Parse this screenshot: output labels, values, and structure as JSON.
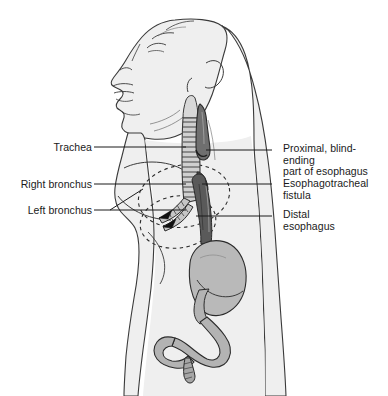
{
  "figure": {
    "width": 388,
    "height": 396,
    "background_color": "#ffffff"
  },
  "colors": {
    "outline": "#3a3a3a",
    "body_fill": "#efefef",
    "organ_fill": "#b9b9b9",
    "organ_fill_dark": "#9a9a9a",
    "trachea_fill": "#d0d0d0",
    "esophagus_dark": "#4a4a4a",
    "leader_line": "#1a1a1a",
    "text": "#1a1a1a",
    "dashed_lung": "#2b2b2b"
  },
  "labels": {
    "left": [
      {
        "id": "trachea",
        "text": "Trachea",
        "align": "right",
        "leader": {
          "x1": 94,
          "y1": 147,
          "x2": 186,
          "y2": 147
        }
      },
      {
        "id": "right-bronchus",
        "text": "Right bronchus",
        "align": "right",
        "leader": {
          "x1": 94,
          "y1": 184,
          "x2": 186,
          "y2": 184
        }
      },
      {
        "id": "left-bronchus",
        "text": "Left bronchus",
        "align": "right",
        "leader": {
          "x1": 94,
          "y1": 210,
          "x2": 186,
          "y2": 210
        }
      }
    ],
    "right": [
      {
        "id": "proximal-esophagus",
        "text": "Proximal, blind-ending\npart of esophagus",
        "align": "left",
        "leader": {
          "x1": 272,
          "y1": 150,
          "x2": 206,
          "y2": 150
        }
      },
      {
        "id": "esophagotracheal-fistula",
        "text": "Esophagotracheal\nfistula",
        "align": "left",
        "leader": {
          "x1": 272,
          "y1": 184,
          "x2": 202,
          "y2": 184
        }
      },
      {
        "id": "distal-esophagus",
        "text": "Distal\nesophagus",
        "align": "left",
        "leader": {
          "x1": 272,
          "y1": 216,
          "x2": 196,
          "y2": 216
        }
      }
    ]
  },
  "anatomy_parts": [
    {
      "name": "head-profile",
      "description": "Infant head in left profile, chin raised"
    },
    {
      "name": "neck",
      "description": "Extended neck"
    },
    {
      "name": "torso",
      "description": "Chest and abdomen body outline"
    },
    {
      "name": "arm",
      "description": "Shoulder and upper arm"
    },
    {
      "name": "trachea",
      "description": "Windpipe with cartilage rings"
    },
    {
      "name": "proximal-esophageal-pouch",
      "description": "Blind-ending upper esophageal pouch"
    },
    {
      "name": "distal-esophagus",
      "description": "Lower esophageal segment from fistula to stomach"
    },
    {
      "name": "right-bronchus",
      "description": "Right mainstem bronchus"
    },
    {
      "name": "left-bronchus",
      "description": "Left mainstem bronchus"
    },
    {
      "name": "lung-outline",
      "description": "Dashed lung field outlines"
    },
    {
      "name": "stomach",
      "description": "Stomach"
    },
    {
      "name": "duodenum",
      "description": "Duodenum and proximal small bowel"
    }
  ]
}
